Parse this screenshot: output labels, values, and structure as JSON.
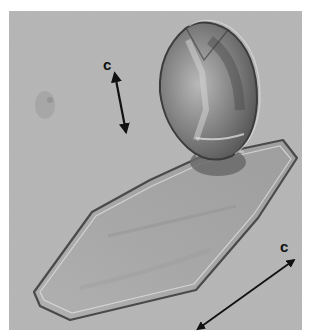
{
  "image": {
    "description": "Grayscale light micrograph of an elongated prismatic crystal with an ovoid crystal attached at its upper end",
    "background_color": "#b4b4b4",
    "frame_color": "#ffffff"
  },
  "annotations": [
    {
      "id": "c-axis-upper",
      "label": "c",
      "type": "arrow",
      "direction": "vertical-slight-tilt",
      "heads": "double"
    },
    {
      "id": "c-axis-lower",
      "label": "c",
      "type": "arrow",
      "direction": "diagonal",
      "heads": "double"
    }
  ]
}
